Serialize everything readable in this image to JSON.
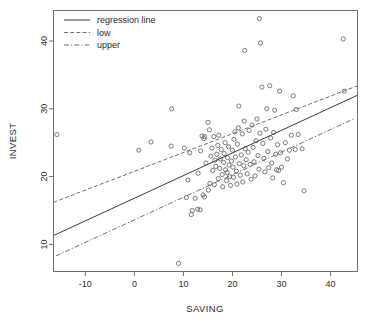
{
  "chart_data": {
    "type": "scatter",
    "title": "",
    "xlabel": "SAVING",
    "ylabel": "INVEST",
    "xlim": [
      -16.5,
      45.5
    ],
    "ylim": [
      6.0,
      44.5
    ],
    "xticks": [
      -10,
      0,
      10,
      20,
      30,
      40
    ],
    "yticks": [
      10,
      20,
      30,
      40
    ],
    "grid": false,
    "legend_position": "top-left",
    "legend": [
      {
        "label": "regression line",
        "style": "solid"
      },
      {
        "label": "low",
        "style": "dashed"
      },
      {
        "label": "upper",
        "style": "dash-dot"
      }
    ],
    "series": [
      {
        "name": "observations",
        "marker": "open-circle",
        "points": [
          [
            -15.8,
            26.2
          ],
          [
            0.9,
            23.9
          ],
          [
            3.4,
            25.1
          ],
          [
            7.6,
            30.0
          ],
          [
            7.5,
            24.5
          ],
          [
            9.0,
            7.2
          ],
          [
            10.2,
            24.2
          ],
          [
            10.6,
            16.9
          ],
          [
            10.9,
            19.5
          ],
          [
            11.3,
            23.5
          ],
          [
            11.8,
            15.0
          ],
          [
            11.6,
            14.4
          ],
          [
            12.4,
            16.8
          ],
          [
            12.9,
            15.2
          ],
          [
            13.4,
            15.1
          ],
          [
            13.0,
            20.5
          ],
          [
            13.5,
            23.8
          ],
          [
            13.8,
            26.0
          ],
          [
            14.2,
            25.6
          ],
          [
            14.3,
            25.9
          ],
          [
            14.0,
            17.3
          ],
          [
            14.3,
            17.0
          ],
          [
            14.6,
            22.0
          ],
          [
            15.0,
            28.0
          ],
          [
            15.3,
            26.9
          ],
          [
            15.1,
            18.0
          ],
          [
            15.4,
            19.0
          ],
          [
            15.6,
            23.0
          ],
          [
            15.8,
            24.2
          ],
          [
            16.0,
            20.9
          ],
          [
            16.2,
            25.9
          ],
          [
            16.4,
            22.4
          ],
          [
            16.3,
            18.8
          ],
          [
            16.6,
            21.5
          ],
          [
            16.8,
            23.3
          ],
          [
            17.0,
            24.6
          ],
          [
            17.2,
            26.1
          ],
          [
            17.1,
            19.7
          ],
          [
            17.4,
            21.2
          ],
          [
            17.5,
            22.6
          ],
          [
            17.7,
            24.0
          ],
          [
            17.9,
            20.3
          ],
          [
            18.0,
            18.5
          ],
          [
            18.2,
            22.1
          ],
          [
            18.3,
            23.4
          ],
          [
            18.5,
            25.0
          ],
          [
            18.6,
            21.0
          ],
          [
            18.8,
            19.4
          ],
          [
            18.9,
            20.6
          ],
          [
            19.0,
            22.8
          ],
          [
            19.2,
            24.4
          ],
          [
            19.3,
            21.7
          ],
          [
            19.4,
            20.0
          ],
          [
            19.6,
            18.7
          ],
          [
            19.8,
            22.3
          ],
          [
            20.0,
            23.9
          ],
          [
            20.1,
            21.4
          ],
          [
            20.2,
            19.9
          ],
          [
            20.3,
            25.5
          ],
          [
            20.5,
            26.6
          ],
          [
            20.6,
            22.9
          ],
          [
            20.8,
            20.8
          ],
          [
            20.9,
            18.9
          ],
          [
            21.0,
            24.8
          ],
          [
            21.2,
            27.2
          ],
          [
            21.3,
            30.4
          ],
          [
            21.4,
            21.9
          ],
          [
            21.6,
            20.2
          ],
          [
            21.8,
            23.2
          ],
          [
            22.0,
            26.3
          ],
          [
            22.1,
            19.2
          ],
          [
            22.3,
            21.6
          ],
          [
            22.4,
            28.2
          ],
          [
            22.6,
            24.1
          ],
          [
            22.8,
            22.5
          ],
          [
            22.5,
            38.6
          ],
          [
            23.0,
            20.4
          ],
          [
            23.2,
            23.6
          ],
          [
            23.4,
            26.8
          ],
          [
            23.6,
            21.8
          ],
          [
            23.8,
            19.6
          ],
          [
            24.0,
            27.6
          ],
          [
            24.2,
            24.3
          ],
          [
            24.4,
            22.2
          ],
          [
            24.6,
            20.1
          ],
          [
            24.8,
            25.3
          ],
          [
            25.0,
            28.5
          ],
          [
            25.2,
            23.1
          ],
          [
            25.4,
            21.1
          ],
          [
            25.6,
            26.4
          ],
          [
            25.5,
            43.3
          ],
          [
            25.7,
            39.7
          ],
          [
            26.0,
            33.2
          ],
          [
            26.2,
            24.9
          ],
          [
            26.4,
            22.7
          ],
          [
            26.6,
            20.7
          ],
          [
            26.8,
            27.0
          ],
          [
            27.0,
            30.0
          ],
          [
            27.2,
            23.7
          ],
          [
            27.4,
            21.3
          ],
          [
            27.6,
            33.4
          ],
          [
            27.8,
            25.7
          ],
          [
            28.0,
            22.0
          ],
          [
            28.2,
            19.8
          ],
          [
            28.4,
            26.5
          ],
          [
            28.6,
            29.8
          ],
          [
            28.8,
            23.3
          ],
          [
            29.0,
            21.0
          ],
          [
            29.2,
            24.7
          ],
          [
            29.4,
            20.9
          ],
          [
            29.6,
            32.6
          ],
          [
            29.8,
            23.5
          ],
          [
            30.0,
            21.4
          ],
          [
            30.4,
            19.1
          ],
          [
            30.8,
            25.0
          ],
          [
            31.2,
            22.6
          ],
          [
            31.6,
            23.9
          ],
          [
            32.0,
            26.1
          ],
          [
            32.4,
            31.9
          ],
          [
            32.8,
            24.0
          ],
          [
            33.0,
            29.9
          ],
          [
            33.4,
            26.2
          ],
          [
            34.2,
            24.1
          ],
          [
            34.6,
            17.9
          ],
          [
            42.6,
            40.3
          ],
          [
            42.8,
            32.6
          ]
        ]
      }
    ],
    "lines": [
      {
        "name": "regression line",
        "style": "solid",
        "x0": -16.5,
        "y0": 11.3,
        "x1": 45.5,
        "y1": 32.0
      },
      {
        "name": "low",
        "style": "dashed",
        "x0": -16.5,
        "y0": 16.2,
        "x1": 45.5,
        "y1": 33.4
      },
      {
        "name": "upper",
        "style": "dash-dot",
        "x0": -16.0,
        "y0": 8.3,
        "x1": 45.0,
        "y1": 28.6
      }
    ]
  },
  "axes": {
    "x_tick_labels": [
      "-10",
      "0",
      "10",
      "20",
      "30",
      "40"
    ],
    "y_tick_labels": [
      "10",
      "20",
      "30",
      "40"
    ],
    "x_axis_title": "SAVING",
    "y_axis_title": "INVEST"
  },
  "legend": {
    "items": [
      {
        "label": "regression line"
      },
      {
        "label": "low"
      },
      {
        "label": "upper"
      }
    ]
  },
  "colors": {
    "background": "#ffffff",
    "frame": "#6f6f6f",
    "point": "#5a5a5a",
    "line": "#3a3a3a",
    "text": "#2b2b2b"
  }
}
